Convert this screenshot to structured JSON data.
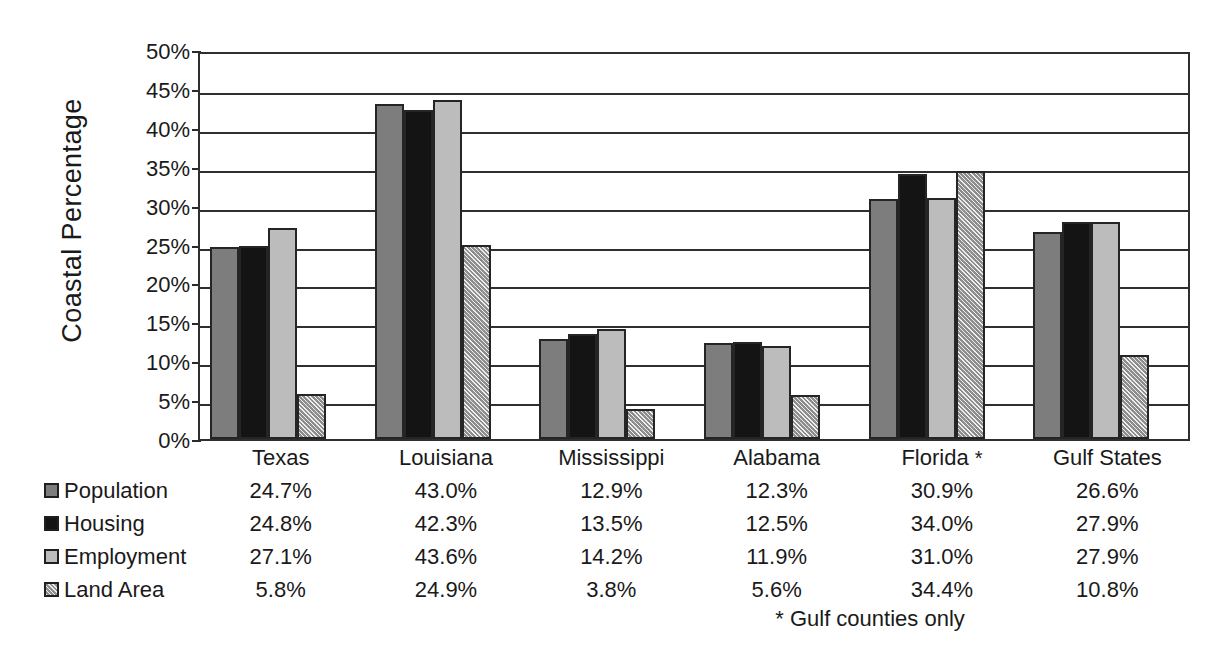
{
  "chart_data": {
    "type": "bar",
    "title": "",
    "xlabel": "",
    "ylabel": "Coastal Percentage",
    "ylim": [
      0,
      50
    ],
    "ytick_labels": [
      "50%",
      "45%",
      "40%",
      "35%",
      "30%",
      "25%",
      "20%",
      "15%",
      "10%",
      "5%",
      "0%"
    ],
    "ytick_values": [
      50,
      45,
      40,
      35,
      30,
      25,
      20,
      15,
      10,
      5,
      0
    ],
    "grid": true,
    "legend_position": "bottom-left",
    "categories": [
      "Texas",
      "Louisiana",
      "Mississippi",
      "Alabama",
      "Florida *",
      "Gulf States"
    ],
    "series": [
      {
        "name": "Population",
        "color": "#7d7d7d",
        "values": [
          24.7,
          43.0,
          12.9,
          12.3,
          30.9,
          26.6
        ],
        "labels": [
          "24.7%",
          "43.0%",
          "12.9%",
          "12.3%",
          "30.9%",
          "26.6%"
        ]
      },
      {
        "name": "Housing",
        "color": "#141414",
        "values": [
          24.8,
          42.3,
          13.5,
          12.5,
          34.0,
          27.9
        ],
        "labels": [
          "24.8%",
          "42.3%",
          "13.5%",
          "12.5%",
          "34.0%",
          "27.9%"
        ]
      },
      {
        "name": "Employment",
        "color": "#bcbcbc",
        "values": [
          27.1,
          43.6,
          14.2,
          11.9,
          31.0,
          27.9
        ],
        "labels": [
          "27.1%",
          "43.6%",
          "14.2%",
          "11.9%",
          "31.0%",
          "27.9%"
        ]
      },
      {
        "name": "Land Area",
        "color": "#8d8d8d",
        "pattern": "diagonal-hatch",
        "values": [
          5.8,
          24.9,
          3.8,
          5.6,
          34.4,
          10.8
        ],
        "labels": [
          "5.8%",
          "24.9%",
          "3.8%",
          "5.6%",
          "34.4%",
          "10.8%"
        ]
      }
    ],
    "annotations": [
      "* Gulf counties only"
    ]
  },
  "axis": {
    "y_title": "Coastal Percentage"
  },
  "footnote": {
    "text": "* Gulf counties only"
  }
}
